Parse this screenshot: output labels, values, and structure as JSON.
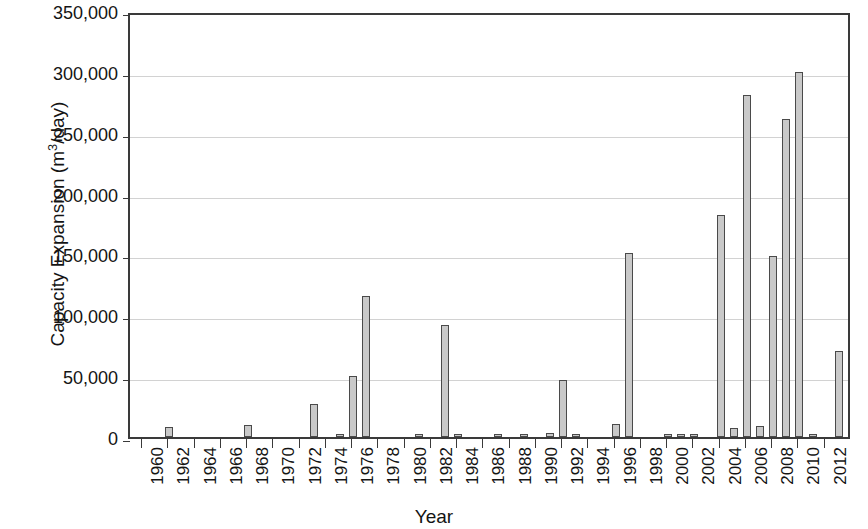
{
  "chart_data": {
    "type": "bar",
    "title": "",
    "xlabel": "Year",
    "ylabel": "Capacity Expansion (m³/day)",
    "ylabel_parts": {
      "prefix": "Capacity Expansion (m",
      "sup": "3",
      "suffix": "/day)"
    },
    "xlim": [
      1959,
      2014
    ],
    "ylim": [
      0,
      350000
    ],
    "ytick_step": 50000,
    "grid": true,
    "legend": null,
    "bar_fill_color": "#c9c9c9",
    "bar_border_color": "#4a4a4a",
    "gridline_color": "#d2d2d2",
    "axis_color": "#3a3a3a",
    "y_tick_labels": [
      "350,000",
      "300,000",
      "250,000",
      "200,000",
      "150,000",
      "100,000",
      "50,000",
      "0"
    ],
    "y_tick_values": [
      350000,
      300000,
      250000,
      200000,
      150000,
      100000,
      50000,
      0
    ],
    "x_tick_labels": [
      "1960",
      "1962",
      "1964",
      "1966",
      "1968",
      "1970",
      "1972",
      "1974",
      "1976",
      "1978",
      "1980",
      "1982",
      "1984",
      "1986",
      "1988",
      "1990",
      "1992",
      "1994",
      "1996",
      "1998",
      "2000",
      "2002",
      "2004",
      "2006",
      "2008",
      "2010",
      "2012"
    ],
    "x_tick_values": [
      1960,
      1962,
      1964,
      1966,
      1968,
      1970,
      1972,
      1974,
      1976,
      1978,
      1980,
      1982,
      1984,
      1986,
      1988,
      1990,
      1992,
      1994,
      1996,
      1998,
      2000,
      2002,
      2004,
      2006,
      2008,
      2010,
      2012
    ],
    "categories": [
      1960,
      1961,
      1962,
      1963,
      1964,
      1965,
      1966,
      1967,
      1968,
      1969,
      1970,
      1971,
      1972,
      1973,
      1974,
      1975,
      1976,
      1977,
      1978,
      1979,
      1980,
      1981,
      1982,
      1983,
      1984,
      1985,
      1986,
      1987,
      1988,
      1989,
      1990,
      1991,
      1992,
      1993,
      1994,
      1995,
      1996,
      1997,
      1998,
      1999,
      2000,
      2001,
      2002,
      2003,
      2004,
      2005,
      2006,
      2007,
      2008,
      2009,
      2010,
      2011,
      2012,
      2013
    ],
    "values": [
      0,
      0,
      8000,
      0,
      0,
      0,
      0,
      0,
      10000,
      0,
      0,
      0,
      0,
      27000,
      0,
      1500,
      50000,
      116000,
      0,
      0,
      0,
      1500,
      0,
      92000,
      2000,
      0,
      0,
      1500,
      0,
      2000,
      0,
      3000,
      47000,
      2000,
      0,
      0,
      11000,
      151000,
      0,
      0,
      1500,
      2500,
      1500,
      0,
      182000,
      7500,
      281000,
      9000,
      149000,
      261000,
      300000,
      1500,
      0,
      71000
    ]
  }
}
